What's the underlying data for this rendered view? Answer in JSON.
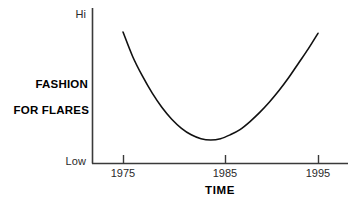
{
  "chart_data": {
    "type": "line",
    "title": "",
    "subtitle": "",
    "xlabel": "TIME",
    "ylabel": "FASHION\nFOR FLARES",
    "ylabel_line1": "FASHION",
    "ylabel_line2": "FOR FLARES",
    "x_tick_labels": [
      "1975",
      "1985",
      "1995"
    ],
    "x_tick_values": [
      1975,
      1985,
      1995
    ],
    "y_tick_labels": [
      "Hi",
      "Low"
    ],
    "y_axis_top_label": "Hi",
    "y_axis_bottom_label": "Low",
    "xlim": [
      1972,
      1998
    ],
    "ylim": [
      0,
      100
    ],
    "grid": false,
    "legend": null,
    "annotations": [],
    "series": [
      {
        "name": "Fashion for flares",
        "comment": "U-shaped curve: high in 1975, minimum around 1983, high again by 1995",
        "x": [
          1975,
          1976,
          1977,
          1978,
          1979,
          1980,
          1981,
          1982,
          1983,
          1984,
          1985,
          1986,
          1987,
          1988,
          1989,
          1990,
          1991,
          1992,
          1993,
          1994,
          1995
        ],
        "y": [
          92,
          73,
          58,
          45,
          34,
          25,
          18,
          13,
          10,
          9,
          10,
          13,
          17,
          23,
          30,
          38,
          47,
          57,
          68,
          79,
          91
        ],
        "color": "#111111",
        "linewidth": 1.6
      }
    ],
    "axis_color": "#3a3a3a",
    "curve_color": "#111111",
    "background": "#ffffff"
  },
  "geometry": {
    "y_axis_x": 92,
    "y_axis_top": 8,
    "x_axis_y": 163,
    "x_axis_left": 92,
    "x_axis_right": 348,
    "tick_x_1975": 123,
    "tick_x_1985": 225,
    "tick_x_1995": 318,
    "curve_start_x": 112,
    "curve_start_y": 32,
    "curve_min_x": 208,
    "curve_min_y": 140,
    "curve_end_x": 331,
    "curve_end_y": 33
  }
}
